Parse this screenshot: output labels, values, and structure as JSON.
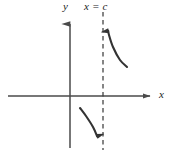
{
  "figure": {
    "kind": "coordinate-plane-diagram",
    "background_color": "#ffffff",
    "ink_color": "#333333",
    "axis_color": "#4a4a4a"
  },
  "labels": {
    "y_axis": "y",
    "x_axis": "x",
    "asymptote": "x = c",
    "asymptote_var": "x",
    "asymptote_equals": "=",
    "asymptote_value": "c"
  },
  "chart_data": {
    "type": "line",
    "title": "",
    "xlabel": "x",
    "ylabel": "y",
    "grid": false,
    "legend": "none",
    "annotations": [
      {
        "name": "vertical-asymptote",
        "text": "x = c",
        "style": "dashed",
        "orientation": "vertical",
        "x_pixel": 103,
        "y_from_pixel": 12,
        "y_to_pixel": 150
      }
    ],
    "axes": {
      "x_axis": {
        "y_pixel": 96,
        "x_from_pixel": 8,
        "x_to_pixel": 156,
        "arrow": "right"
      },
      "y_axis": {
        "x_pixel": 70,
        "y_from_pixel": 148,
        "y_to_pixel": 16,
        "arrow": "up"
      },
      "origin_pixel": [
        70,
        96
      ]
    },
    "series": [
      {
        "name": "right-branch-to-positive-infinity",
        "arrow_direction": "up",
        "approaches": "+infinity as x approaches c from the right",
        "points_pixel": [
          [
            127,
            67
          ],
          [
            120,
            60
          ],
          [
            113,
            47
          ],
          [
            109,
            35
          ],
          [
            107,
            24
          ]
        ]
      },
      {
        "name": "left-branch-to-negative-infinity",
        "arrow_direction": "down",
        "approaches": "-infinity as x approaches c from the left",
        "points_pixel": [
          [
            80,
            108
          ],
          [
            86,
            116
          ],
          [
            93,
            127
          ],
          [
            97,
            136
          ],
          [
            99,
            143
          ]
        ]
      }
    ]
  }
}
